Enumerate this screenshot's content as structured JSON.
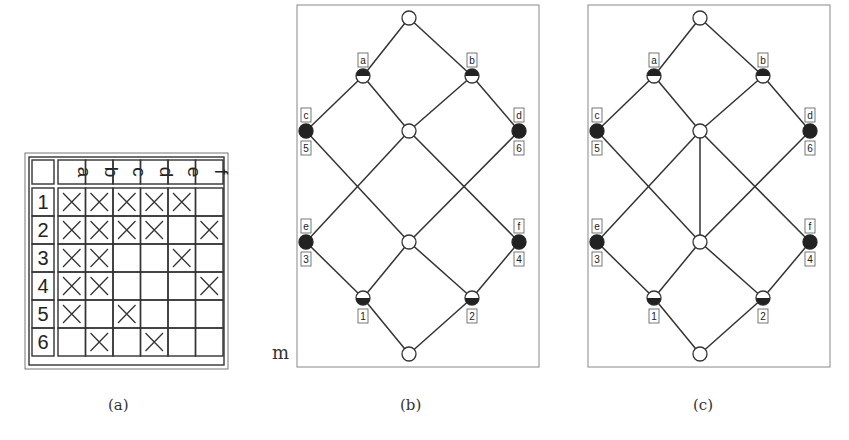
{
  "panels": {
    "a": {
      "caption": "(a)",
      "table": {
        "columns": [
          "a",
          "b",
          "c",
          "d",
          "e",
          "f"
        ],
        "rows": [
          "1",
          "2",
          "3",
          "4",
          "5",
          "6"
        ],
        "incidence": [
          [
            1,
            1,
            1,
            1,
            1,
            0
          ],
          [
            1,
            1,
            1,
            1,
            0,
            1
          ],
          [
            1,
            1,
            0,
            0,
            1,
            0
          ],
          [
            1,
            1,
            0,
            0,
            0,
            1
          ],
          [
            1,
            0,
            1,
            0,
            0,
            0
          ],
          [
            0,
            1,
            0,
            1,
            0,
            0
          ]
        ]
      }
    },
    "b": {
      "caption": "(b)",
      "side_label": "m",
      "labels": {
        "a": "a",
        "b": "b",
        "c": "c",
        "d": "d",
        "e": "e",
        "f": "f",
        "n1": "1",
        "n2": "2",
        "n3": "3",
        "n4": "4",
        "n5": "5",
        "n6": "6"
      }
    },
    "c": {
      "caption": "(c)",
      "labels": {
        "a": "a",
        "b": "b",
        "c": "c",
        "d": "d",
        "e": "e",
        "f": "f",
        "n1": "1",
        "n2": "2",
        "n3": "3",
        "n4": "4",
        "n5": "5",
        "n6": "6"
      }
    }
  }
}
